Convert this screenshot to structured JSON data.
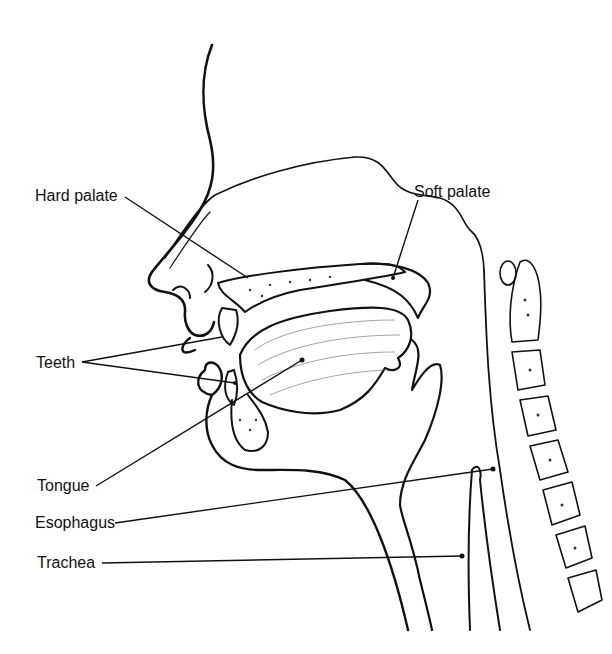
{
  "diagram": {
    "labels": [
      {
        "id": "hard-palate",
        "text": "Hard palate",
        "x": 35,
        "y": 188
      },
      {
        "id": "soft-palate",
        "text": "Soft palate",
        "x": 414,
        "y": 184
      },
      {
        "id": "teeth",
        "text": "Teeth",
        "x": 36,
        "y": 355
      },
      {
        "id": "tongue",
        "text": "Tongue",
        "x": 37,
        "y": 478
      },
      {
        "id": "esophagus",
        "text": "Esophagus",
        "x": 35,
        "y": 515
      },
      {
        "id": "trachea",
        "text": "Trachea",
        "x": 37,
        "y": 555
      }
    ],
    "line_color": "#111111",
    "background": "#ffffff"
  }
}
